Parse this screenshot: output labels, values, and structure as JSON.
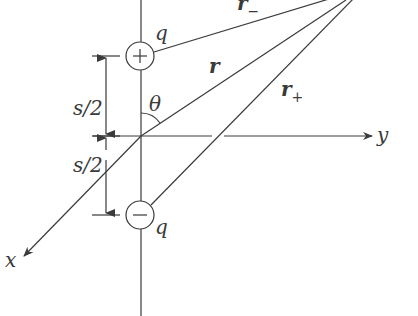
{
  "figure": {
    "type": "electric dipole geometry",
    "colors": {
      "line": "#3a3a3a",
      "background": "#ffffff"
    }
  },
  "labels": {
    "charge_top": "q",
    "charge_bottom": "q",
    "plus_sign": "+",
    "minus_sign": "−",
    "r": "r",
    "r_minus_base": "r",
    "r_minus_sub": "−",
    "r_plus_base": "r",
    "r_plus_sub": "+",
    "theta": "θ",
    "s_half_top": "s/2",
    "s_half_bottom": "s/2",
    "x_axis": "x",
    "y_axis": "y"
  }
}
